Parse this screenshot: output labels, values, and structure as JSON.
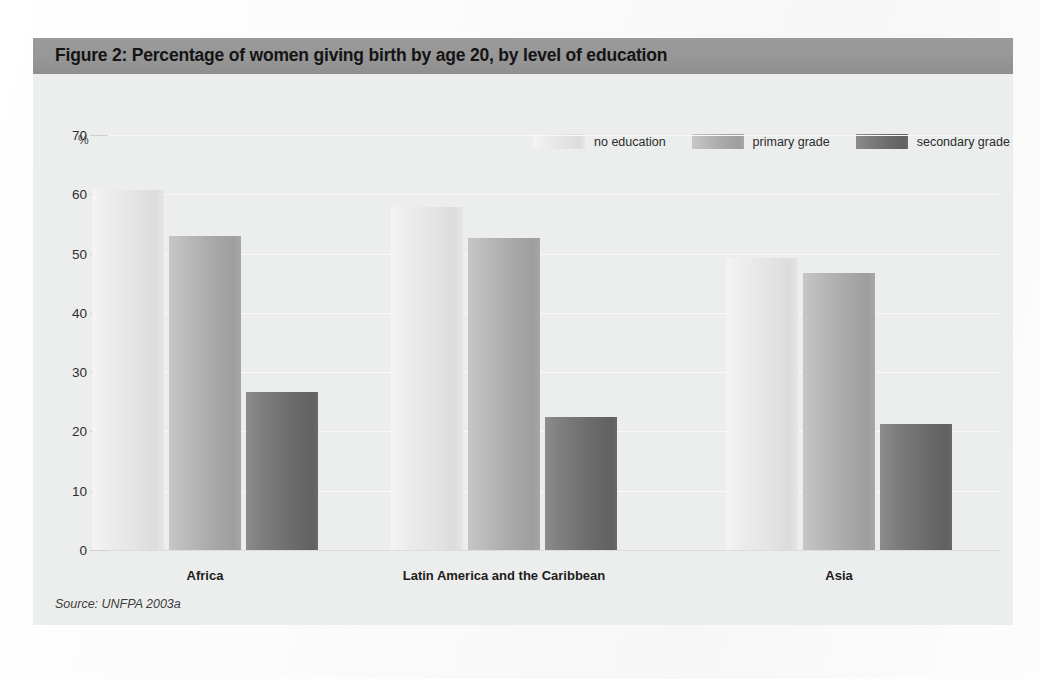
{
  "figure": {
    "title": "Figure 2: Percentage of women giving birth by age 20, by level of education",
    "source_note": "Source: UNFPA 2003a"
  },
  "chart_data": {
    "type": "bar",
    "title": "Figure 2: Percentage of women giving birth by age 20, by level of education",
    "xlabel": "",
    "ylabel": "%",
    "ylim": [
      0,
      70
    ],
    "yticks": [
      0,
      10,
      20,
      30,
      40,
      50,
      60,
      70
    ],
    "ytick_labels": [
      "0",
      "10",
      "20",
      "30",
      "40",
      "50",
      "60",
      "70"
    ],
    "grid": true,
    "legend_position": "top-right",
    "categories": [
      "Africa",
      "Latin America and the Caribbean",
      "Asia"
    ],
    "series": [
      {
        "name": "no education",
        "color": "#e6e6e6",
        "values": [
          60.7,
          57.8,
          49.2
        ]
      },
      {
        "name": "primary grade",
        "color": "#a9a9a9",
        "values": [
          53.0,
          52.6,
          46.7
        ]
      },
      {
        "name": "secondary grade",
        "color": "#6c6c6c",
        "values": [
          26.6,
          22.4,
          21.3
        ]
      }
    ]
  },
  "colors": {
    "title_bar": "#979797",
    "panel_background": "#eceded",
    "no_education": "#e6e6e6",
    "primary_grade": "#a9a9a9",
    "secondary_grade": "#6c6c6c"
  }
}
